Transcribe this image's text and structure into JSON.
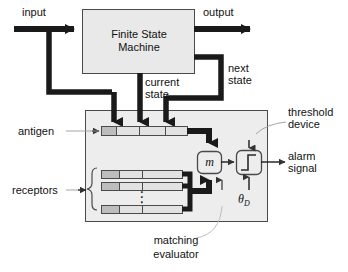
{
  "diagram": {
    "type": "block-diagram",
    "colors": {
      "box_fill": "#e9e9e9",
      "container_fill": "#ededed",
      "cell_fill": "#e2e2e2",
      "cell_fill_dark": "#bdbdbd",
      "stroke": "#4a4a4a",
      "thick_line": "#1a1a1a",
      "thin_leader": "#9a9a9a",
      "text": "#111111"
    }
  },
  "blocks": {
    "fsm": {
      "line1": "Finite State",
      "line2": "Machine"
    },
    "matching_evaluator_box": {
      "symbol": "m"
    },
    "threshold_box": {
      "symbol": "step-function"
    }
  },
  "labels": {
    "input": "input",
    "output": "output",
    "current_state_l1": "current",
    "current_state_l2": "state",
    "next_state_l1": "next",
    "next_state_l2": "state",
    "antigen": "antigen",
    "receptors": "receptors",
    "threshold_device_l1": "threshold",
    "threshold_device_l2": "device",
    "alarm_signal_l1": "alarm",
    "alarm_signal_l2": "signal",
    "matching_evaluator_l1": "matching",
    "matching_evaluator_l2": "evaluator",
    "theta_d": "θ",
    "theta_d_sub": "D",
    "ellipsis": "⋮"
  },
  "antigen_row": {
    "cells": 4,
    "shaded_cells": [
      0
    ]
  },
  "receptor_rows": [
    {
      "cells": 3,
      "shaded_cells": [
        0
      ]
    },
    {
      "cells": 3,
      "shaded_cells": [
        0
      ]
    },
    {
      "cells": 3,
      "shaded_cells": [
        0
      ]
    }
  ]
}
